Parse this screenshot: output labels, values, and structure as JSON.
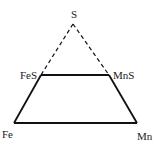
{
  "diagram": {
    "type": "phase-triangle",
    "colors": {
      "line": "#111111",
      "text": "#222222",
      "background": "#ffffff"
    },
    "vertices": {
      "apex": {
        "label": "S",
        "x": 73,
        "y": 24,
        "label_x": 74,
        "label_y": 17
      },
      "upper_left": {
        "label": "FeS",
        "x": 41,
        "y": 75,
        "label_x": 20,
        "label_y": 78
      },
      "upper_right": {
        "label": "MnS",
        "x": 109,
        "y": 75,
        "label_x": 113,
        "label_y": 78
      },
      "lower_left": {
        "label": "Fe",
        "x": 14,
        "y": 123,
        "label_x": 2,
        "label_y": 137
      },
      "lower_right": {
        "label": "Mn",
        "x": 137,
        "y": 123,
        "label_x": 136,
        "label_y": 139
      }
    },
    "edges": [
      {
        "from": "apex",
        "to": "upper_left",
        "style": "dashed"
      },
      {
        "from": "apex",
        "to": "upper_right",
        "style": "dashed"
      },
      {
        "from": "upper_left",
        "to": "upper_right",
        "style": "solid"
      },
      {
        "from": "upper_left",
        "to": "lower_left",
        "style": "solid"
      },
      {
        "from": "upper_right",
        "to": "lower_right",
        "style": "solid"
      },
      {
        "from": "lower_left",
        "to": "lower_right",
        "style": "solid"
      }
    ]
  }
}
